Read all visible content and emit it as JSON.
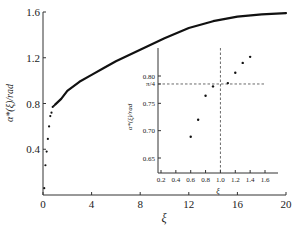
{
  "chart_data": [
    {
      "type": "scatter+line",
      "title": "",
      "xlabel": "ξ",
      "ylabel": "α*(ξ)/rad",
      "xlim": [
        0,
        20
      ],
      "ylim": [
        0,
        1.6
      ],
      "xticks": [
        0,
        4,
        8,
        12,
        16,
        20
      ],
      "xtick_labels": [
        "0",
        "4",
        "8",
        "12",
        "16",
        "20"
      ],
      "yticks": [
        0.4,
        0.8,
        1.2,
        1.6
      ],
      "ytick_labels": [
        "0.4",
        "0.8",
        "1.2",
        "1.6"
      ],
      "grid": false,
      "legend": null,
      "series": [
        {
          "name": "α*(ξ) scatter (low ξ)",
          "style": "points",
          "x": [
            0.1,
            0.2,
            0.3,
            0.4,
            0.5,
            0.6,
            0.7,
            0.8,
            0.9
          ],
          "y": [
            0.06,
            0.26,
            0.38,
            0.49,
            0.6,
            0.69,
            0.72,
            0.77,
            0.78
          ]
        },
        {
          "name": "α*(ξ) curve",
          "style": "line",
          "x": [
            1.0,
            1.5,
            2.0,
            3.0,
            4.0,
            5.0,
            6.0,
            8.0,
            10.0,
            12.0,
            14.0,
            16.0,
            18.0,
            20.0
          ],
          "y": [
            0.79,
            0.84,
            0.91,
            0.99,
            1.05,
            1.11,
            1.17,
            1.27,
            1.37,
            1.46,
            1.52,
            1.56,
            1.58,
            1.59
          ]
        }
      ]
    },
    {
      "type": "scatter",
      "title": "inset",
      "xlabel": "ξ",
      "ylabel": "α*(ξ)/rad",
      "xlim": [
        0.15,
        1.75
      ],
      "ylim": [
        0.625,
        0.85
      ],
      "xticks": [
        0.2,
        0.4,
        0.6,
        0.8,
        1.0,
        1.2,
        1.4,
        1.6
      ],
      "xtick_labels": [
        "0.2",
        "0.4",
        "0.6",
        "0.8",
        "1.0",
        "1.2",
        "1.4",
        "1.6"
      ],
      "yticks": [
        0.65,
        0.7,
        0.75,
        0.7854,
        0.8
      ],
      "ytick_labels": [
        "0.65",
        "0.70",
        "0.75",
        "π/4",
        "0.80"
      ],
      "grid": false,
      "reference_lines": [
        {
          "orientation": "vertical",
          "x": 1.0,
          "style": "dashed"
        },
        {
          "orientation": "horizontal",
          "y": 0.7854,
          "label": "π/4",
          "style": "dashed"
        }
      ],
      "series": [
        {
          "name": "α*(ξ)",
          "x": [
            0.6,
            0.7,
            0.8,
            0.9,
            1.1,
            1.2,
            1.3,
            1.4
          ],
          "y": [
            0.689,
            0.72,
            0.764,
            0.781,
            0.787,
            0.806,
            0.824,
            0.835
          ]
        }
      ]
    }
  ],
  "labels": {
    "main_xlabel": "ξ",
    "main_ylabel": "α*(ξ)/rad",
    "inset_xlabel": "ξ",
    "inset_ylabel": "α*(ξ)/rad",
    "pi_over_4": "π/4"
  }
}
